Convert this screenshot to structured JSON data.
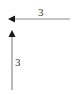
{
  "diagram": {
    "arrows": [
      {
        "id": "horizontal",
        "direction": "left",
        "label": "3"
      },
      {
        "id": "vertical",
        "direction": "up",
        "label": "3"
      }
    ],
    "colors": {
      "line": "#8a8a8a",
      "head": "#1a1a1a",
      "text": "#333333"
    }
  }
}
